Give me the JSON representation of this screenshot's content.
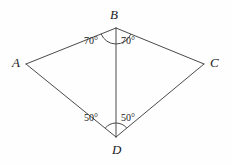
{
  "figure": {
    "kind": "geometry-diagram",
    "background_color": "#fefefe",
    "stroke_color": "#4a4a4a",
    "text_color": "#1a1a1a",
    "stroke_width": 1
  },
  "vertices": {
    "A": {
      "label": "A",
      "x": 26,
      "y": 64
    },
    "B": {
      "label": "B",
      "x": 116,
      "y": 28
    },
    "C": {
      "label": "C",
      "x": 204,
      "y": 64
    },
    "D": {
      "label": "D",
      "x": 116,
      "y": 137
    }
  },
  "edges": [
    {
      "name": "AB",
      "from": "A",
      "to": "B"
    },
    {
      "name": "BC",
      "from": "B",
      "to": "C"
    },
    {
      "name": "CD",
      "from": "C",
      "to": "D"
    },
    {
      "name": "DA",
      "from": "D",
      "to": "A"
    },
    {
      "name": "BD",
      "from": "B",
      "to": "D"
    }
  ],
  "angles": {
    "ABD": {
      "value": "70°",
      "vertex": "B",
      "side": "left"
    },
    "DBC": {
      "value": "70°",
      "vertex": "B",
      "side": "right"
    },
    "ADB": {
      "value": "50°",
      "vertex": "D",
      "side": "left"
    },
    "BDC": {
      "value": "50°",
      "vertex": "D",
      "side": "right"
    }
  },
  "arcs": {
    "at_B": {
      "name": "angle-arc-B",
      "radius": 16
    },
    "at_D": {
      "name": "angle-arc-D",
      "radius": 14
    }
  }
}
